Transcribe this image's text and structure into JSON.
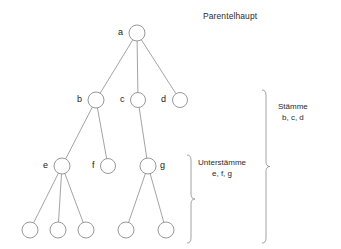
{
  "diagram": {
    "title": "Parentelhaupt",
    "type": "genealogical-tree",
    "background_color": "#ffffff",
    "line_color": "#8c8c8c",
    "text_color": "#1a1a1a",
    "nodes": [
      {
        "id": "a",
        "label": "a",
        "cx": 137,
        "cy": 33,
        "r": 8,
        "label_side": "left",
        "label_x": 118,
        "label_y": 28
      },
      {
        "id": "b",
        "label": "b",
        "cx": 96,
        "cy": 100,
        "r": 8,
        "label_side": "left",
        "label_x": 77,
        "label_y": 95
      },
      {
        "id": "c",
        "label": "c",
        "cx": 138,
        "cy": 100,
        "r": 7.5,
        "label_side": "left",
        "label_x": 120,
        "label_y": 95
      },
      {
        "id": "d",
        "label": "d",
        "cx": 180,
        "cy": 100,
        "r": 7.5,
        "label_side": "left",
        "label_x": 161,
        "label_y": 95
      },
      {
        "id": "e",
        "label": "e",
        "cx": 62,
        "cy": 166,
        "r": 8,
        "label_side": "left",
        "label_x": 43,
        "label_y": 161
      },
      {
        "id": "f",
        "label": "f",
        "cx": 108,
        "cy": 166,
        "r": 7.5,
        "label_side": "left",
        "label_x": 92,
        "label_y": 161
      },
      {
        "id": "g",
        "label": "g",
        "cx": 148,
        "cy": 166,
        "r": 8,
        "label_side": "right",
        "label_x": 160,
        "label_y": 161
      },
      {
        "id": "e1",
        "label": "",
        "cx": 30,
        "cy": 230,
        "r": 8,
        "label_side": "none",
        "label_x": 0,
        "label_y": 0
      },
      {
        "id": "e2",
        "label": "",
        "cx": 58,
        "cy": 230,
        "r": 8,
        "label_side": "none",
        "label_x": 0,
        "label_y": 0
      },
      {
        "id": "e3",
        "label": "",
        "cx": 86,
        "cy": 230,
        "r": 8,
        "label_side": "none",
        "label_x": 0,
        "label_y": 0
      },
      {
        "id": "g1",
        "label": "",
        "cx": 126,
        "cy": 230,
        "r": 8,
        "label_side": "none",
        "label_x": 0,
        "label_y": 0
      },
      {
        "id": "g2",
        "label": "",
        "cx": 166,
        "cy": 230,
        "r": 8,
        "label_side": "none",
        "label_x": 0,
        "label_y": 0
      }
    ],
    "edges": [
      {
        "from": "a",
        "to": "b"
      },
      {
        "from": "a",
        "to": "c"
      },
      {
        "from": "a",
        "to": "d"
      },
      {
        "from": "b",
        "to": "e"
      },
      {
        "from": "b",
        "to": "f"
      },
      {
        "from": "c",
        "to": "g"
      },
      {
        "from": "e",
        "to": "e1"
      },
      {
        "from": "e",
        "to": "e2"
      },
      {
        "from": "e",
        "to": "e3"
      },
      {
        "from": "g",
        "to": "g1"
      },
      {
        "from": "g",
        "to": "g2"
      }
    ],
    "braces": [
      {
        "id": "unterstaemme",
        "line1": "Unterstämme",
        "line2": "e, f, g",
        "x": 191,
        "top": 155,
        "bottom": 243,
        "label_x": 198,
        "label_y": 158
      },
      {
        "id": "staemme",
        "line1": "Stämme",
        "line2": "b, c, d",
        "x": 266,
        "top": 90,
        "bottom": 243,
        "label_x": 278,
        "label_y": 102
      }
    ],
    "title_x": 203,
    "title_y": 11
  }
}
